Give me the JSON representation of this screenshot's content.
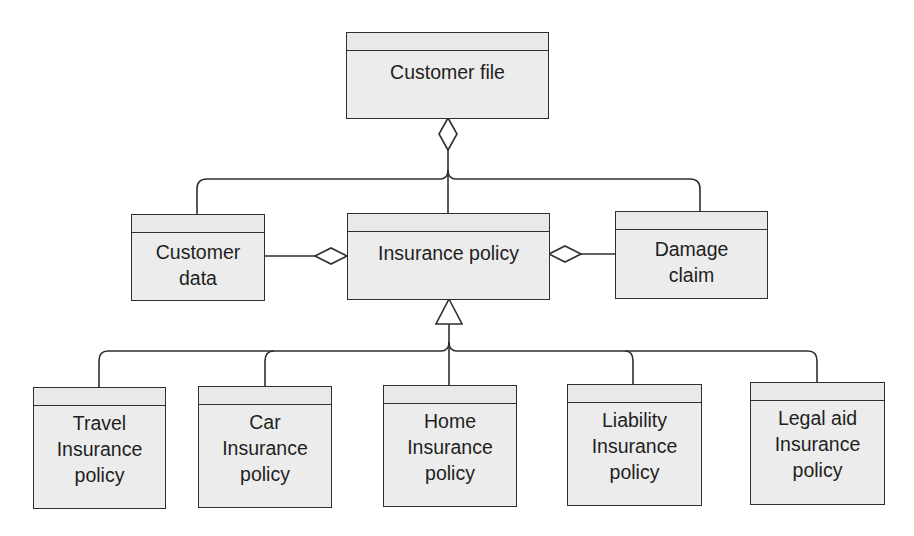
{
  "diagram": {
    "type": "uml-class-diagram",
    "colors": {
      "line": "#2f2f2f",
      "box_fill": "#ececec",
      "text": "#1f1f1f",
      "background": "#ffffff"
    },
    "classes": {
      "customer_file": {
        "label": "Customer file"
      },
      "customer_data": {
        "label": "Customer\ndata"
      },
      "insurance_policy": {
        "label": "Insurance policy"
      },
      "damage_claim": {
        "label": "Damage\nclaim"
      },
      "travel": {
        "label": "Travel\nInsurance\npolicy"
      },
      "car": {
        "label": "Car\nInsurance\npolicy"
      },
      "home": {
        "label": "Home\nInsurance\npolicy"
      },
      "liability": {
        "label": "Liability\nInsurance\npolicy"
      },
      "legal_aid": {
        "label": "Legal aid\nInsurance\npolicy"
      }
    },
    "relationships": [
      {
        "type": "aggregation",
        "whole": "Customer file",
        "parts": [
          "Customer data",
          "Insurance policy",
          "Damage claim"
        ]
      },
      {
        "type": "aggregation",
        "whole": "Insurance policy",
        "part": "Customer data"
      },
      {
        "type": "aggregation",
        "whole": "Insurance policy",
        "part": "Damage claim"
      },
      {
        "type": "generalization",
        "parent": "Insurance policy",
        "children": [
          "Travel Insurance policy",
          "Car Insurance policy",
          "Home Insurance policy",
          "Liability Insurance policy",
          "Legal aid Insurance policy"
        ]
      }
    ]
  }
}
